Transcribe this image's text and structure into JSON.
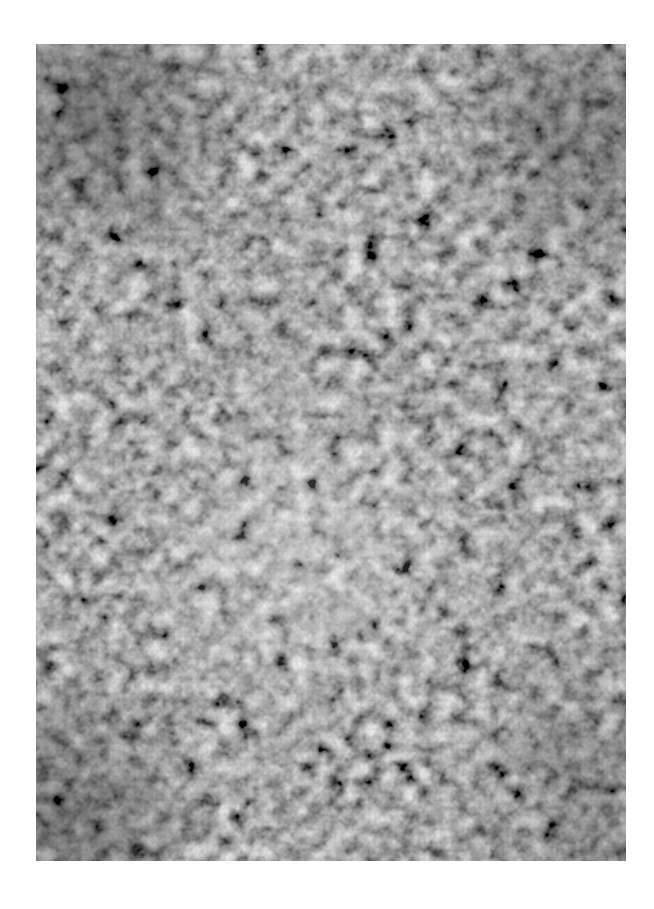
{
  "image": {
    "kind": "grayscale speckle / microscopy texture photograph",
    "colors": {
      "background": "#ffffff",
      "mid_gray": "#8f8f8f",
      "dark": "#1e1e1e",
      "light": "#dcdcdc"
    }
  }
}
